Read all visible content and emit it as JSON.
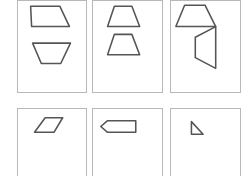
{
  "figure": {
    "top_row": [
      {
        "id": "panel-1",
        "shapes": [
          "trapezoid-up",
          "trapezoid-down"
        ]
      },
      {
        "id": "panel-2",
        "shapes": [
          "trapezoid-up",
          "parallelogram-trapezoid"
        ]
      },
      {
        "id": "panel-3",
        "shapes": [
          "trapezoid-up",
          "rotated-trapezoid"
        ]
      }
    ],
    "options": [
      {
        "id": "option-1",
        "shape": "parallelogram"
      },
      {
        "id": "option-2",
        "shape": "pentagon-arrow"
      },
      {
        "id": "option-3",
        "shape": "triangle"
      }
    ]
  }
}
